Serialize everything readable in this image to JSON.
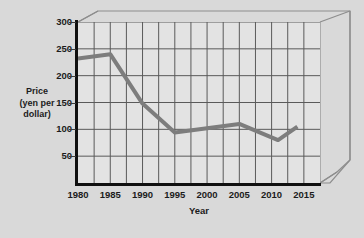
{
  "chart_data": {
    "type": "line",
    "title": "",
    "xlabel": "Year",
    "ylabel": "Price",
    "ylabel_sub_1": "(yen per",
    "ylabel_sub_2": "dollar)",
    "ylabel_full": "Price (yen per dollar)",
    "x": [
      1980,
      1985,
      1990,
      1995,
      2000,
      2005,
      2011,
      2014
    ],
    "values": [
      232,
      240,
      148,
      94,
      102,
      110,
      80,
      105
    ],
    "series": [
      {
        "name": "Price (yen per dollar)",
        "values": [
          232,
          240,
          148,
          94,
          102,
          110,
          80,
          105
        ]
      }
    ],
    "xlim": [
      1980,
      2017.5
    ],
    "ylim": [
      0,
      300
    ],
    "xtick_labels": [
      "1980",
      "1985",
      "1990",
      "1995",
      "2000",
      "2005",
      "2010",
      "2015"
    ],
    "xtick_values": [
      1980,
      1985,
      1990,
      1995,
      2000,
      2005,
      2010,
      2015
    ],
    "ytick_labels": [
      "300",
      "250",
      "200",
      "150",
      "100",
      "50"
    ],
    "ytick_values": [
      300,
      250,
      200,
      150,
      100,
      50
    ],
    "grid": true,
    "grid_x_minor_step": 2.5,
    "grid_y_step": 50,
    "legend": "none",
    "line_color": "#7d7d7d",
    "grid_color": "#5a5a5a",
    "axis_color": "#101010",
    "plot_bg": "#e3e3e3",
    "page_bg": "#d9d9d9",
    "line_width_px": 4
  }
}
